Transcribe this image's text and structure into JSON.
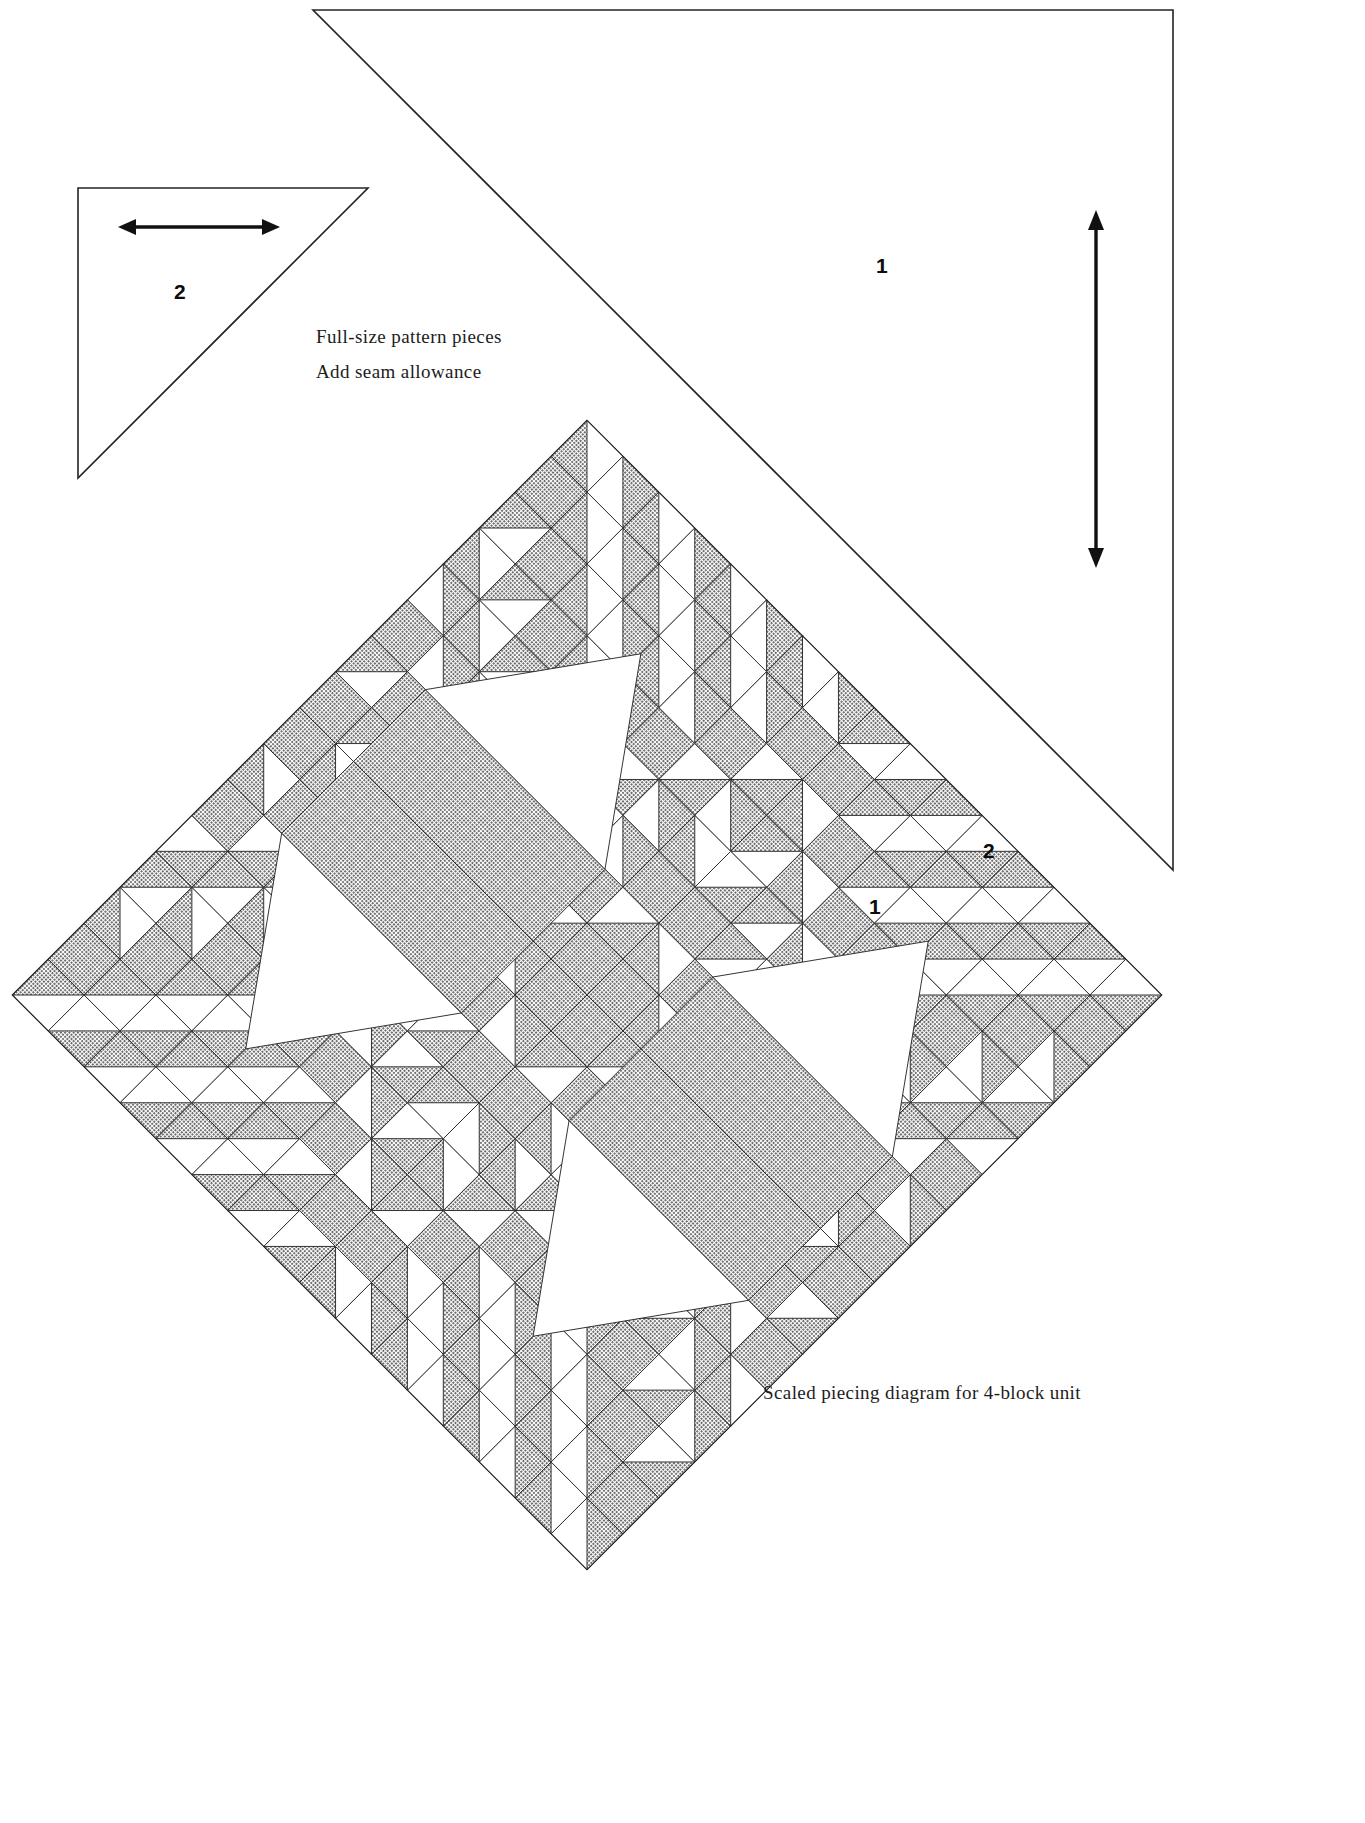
{
  "document": {
    "kind": "quilt-pattern-sheet",
    "background_color": "#ffffff",
    "ink_color": "#1a1a1a",
    "shade_color": "#8a8a8a",
    "light_color": "#ffffff",
    "width": 1365,
    "height": 1823
  },
  "captions": {
    "full_size": "Full-size pattern pieces",
    "add_seam": "Add seam allowance",
    "scaled": "Scaled piecing diagram for 4-block unit"
  },
  "pattern_pieces": [
    {
      "id": "piece-2",
      "label": "2",
      "shape": "right-triangle",
      "orientation": "legs at top and left, hypotenuse from top-right to bottom-left",
      "grainline": "horizontal double-headed arrow",
      "legs_px": 290,
      "outline_color": "#1a1a1a",
      "fill_color": "#ffffff"
    },
    {
      "id": "piece-1",
      "label": "1",
      "shape": "right-triangle",
      "orientation": "legs at top and right, hypotenuse from top-left to bottom-right",
      "grainline": "vertical double-headed arrow",
      "legs_px": 860,
      "outline_color": "#1a1a1a",
      "fill_color": "#ffffff"
    }
  ],
  "diagram_labels": [
    {
      "id": "diagram-label-1",
      "label": "1",
      "points_to": "large light triangle in upper-right block"
    },
    {
      "id": "diagram-label-2",
      "label": "2",
      "points_to": "small shaded sawtooth triangle near right corner"
    }
  ],
  "chart_data": {
    "type": "diagram",
    "title": "Scaled piecing diagram for 4-block unit",
    "grid": {
      "blocks": 4,
      "block_rows": 2,
      "block_cols": 2,
      "units_per_block": 8,
      "total_units": 16
    },
    "rotation_deg": 45,
    "colors": {
      "shaded": "#8a8a8a",
      "light": "#ffffff",
      "line": "#2a2a2a"
    },
    "piece_numbers": [
      "1",
      "2"
    ]
  }
}
